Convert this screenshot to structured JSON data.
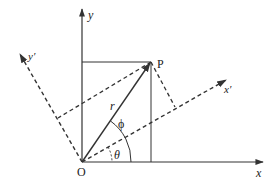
{
  "diagram": {
    "labels": {
      "y_axis": "y",
      "x_axis": "x",
      "y_prime": "y′",
      "x_prime": "x′",
      "point": "P",
      "origin": "O",
      "radius": "r",
      "phi": "ϕ",
      "theta": "θ"
    },
    "colors": {
      "line": "#333333",
      "background": "#ffffff"
    }
  }
}
